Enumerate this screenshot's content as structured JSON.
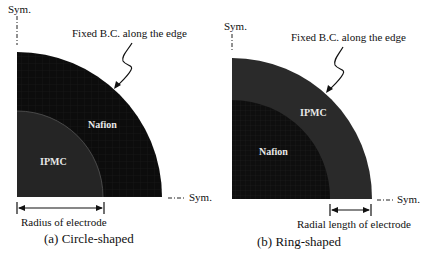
{
  "panels": [
    {
      "id": "a",
      "caption": "(a) Circle-shaped",
      "sym_top": "Sym.",
      "sym_right": "Sym.",
      "annotation": "Fixed B.C. along the edge",
      "outer_region": "Nafion",
      "inner_region": "IPMC",
      "dimension_label": "Radius of electrode",
      "colors": {
        "outer": "#0c0c0c",
        "inner": "#262626"
      }
    },
    {
      "id": "b",
      "caption": "(b) Ring-shaped",
      "sym_top": "Sym.",
      "sym_right": "Sym.",
      "annotation": "Fixed B.C. along the edge",
      "outer_region": "IPMC",
      "inner_region": "Nafion",
      "dimension_label": "Radial length of electrode",
      "colors": {
        "outer": "#2a2a2a",
        "inner": "#0e0e0e"
      }
    }
  ]
}
